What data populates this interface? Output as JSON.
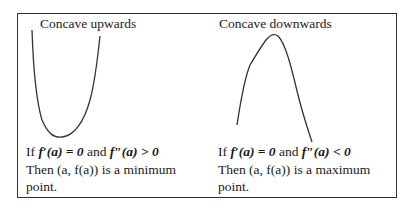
{
  "left_panel": {
    "title": "Concave upwards",
    "condition": {
      "prefix": "If ",
      "first_derivative": "f′(a) = 0",
      "conj": " and ",
      "second_derivative": "f″(a) > 0"
    },
    "conclusion_line1": "Then (a, f(a)) is a minimum",
    "conclusion_line2": "point.",
    "curve": "u-shaped"
  },
  "right_panel": {
    "title": "Concave downwards",
    "condition": {
      "prefix": "If ",
      "first_derivative": "f′(a) = 0",
      "conj": " and ",
      "second_derivative": "f″(a) < 0"
    },
    "conclusion_line1": "Then (a, f(a)) is a maximum",
    "conclusion_line2": "point.",
    "curve": "arch-shaped"
  },
  "colors": {
    "stroke": "#333333",
    "text": "#1a1a1a",
    "background": "#ffffff"
  }
}
